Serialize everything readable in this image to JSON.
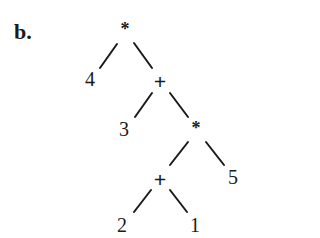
{
  "figure": {
    "label": "b."
  },
  "tree": {
    "nodes": [
      {
        "id": "root",
        "text": "*",
        "type": "operator",
        "x": 125,
        "y": 27
      },
      {
        "id": "n4",
        "text": "4",
        "type": "operand",
        "x": 90,
        "y": 80
      },
      {
        "id": "plus1",
        "text": "+",
        "type": "operator",
        "x": 160,
        "y": 82
      },
      {
        "id": "n3",
        "text": "3",
        "type": "operand",
        "x": 124,
        "y": 130
      },
      {
        "id": "star2",
        "text": "*",
        "type": "operator",
        "x": 196,
        "y": 126
      },
      {
        "id": "plus2",
        "text": "+",
        "type": "operator",
        "x": 160,
        "y": 180
      },
      {
        "id": "n5",
        "text": "5",
        "type": "operand",
        "x": 233,
        "y": 178
      },
      {
        "id": "n2",
        "text": "2",
        "type": "operand",
        "x": 122,
        "y": 226
      },
      {
        "id": "n1",
        "text": "1",
        "type": "operand",
        "x": 195,
        "y": 226
      }
    ],
    "edges": [
      {
        "from": "root",
        "to": "n4",
        "x1": 117,
        "y1": 44,
        "x2": 100,
        "y2": 68
      },
      {
        "from": "root",
        "to": "plus1",
        "x1": 134,
        "y1": 43,
        "x2": 152,
        "y2": 68
      },
      {
        "from": "plus1",
        "to": "n3",
        "x1": 152,
        "y1": 93,
        "x2": 135,
        "y2": 117
      },
      {
        "from": "plus1",
        "to": "star2",
        "x1": 170,
        "y1": 93,
        "x2": 188,
        "y2": 117
      },
      {
        "from": "star2",
        "to": "plus2",
        "x1": 188,
        "y1": 142,
        "x2": 170,
        "y2": 165
      },
      {
        "from": "star2",
        "to": "n5",
        "x1": 206,
        "y1": 142,
        "x2": 224,
        "y2": 165
      },
      {
        "from": "plus2",
        "to": "n2",
        "x1": 151,
        "y1": 190,
        "x2": 134,
        "y2": 212
      },
      {
        "from": "plus2",
        "to": "n1",
        "x1": 170,
        "y1": 190,
        "x2": 187,
        "y2": 212
      }
    ]
  }
}
